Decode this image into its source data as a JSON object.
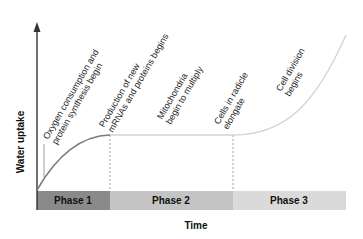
{
  "diagram": {
    "y_axis_label": "Water uptake",
    "x_axis_label": "Time",
    "phases": [
      {
        "label": "Phase 1",
        "color": "#8a8a8a"
      },
      {
        "label": "Phase 2",
        "color": "#c4c4c4"
      },
      {
        "label": "Phase 3",
        "color": "#dadada"
      }
    ],
    "annotations": [
      {
        "line1": "Oxygen consumption and",
        "line2": "protein synthesis begin"
      },
      {
        "line1": "Production of new",
        "line2": "mRNAs and proteins begins"
      },
      {
        "line1": "Mitochondria",
        "line2": "begin to multiply"
      },
      {
        "line1": "Cells in radicle",
        "line2": "elongate"
      },
      {
        "line1": "Cell division",
        "line2": "begins"
      }
    ],
    "colors": {
      "curve_phase1": "#7a7a7a",
      "curve_phase2": "#bdbdbd",
      "curve_phase3": "#d4d4d4",
      "axis": "#333333"
    }
  }
}
